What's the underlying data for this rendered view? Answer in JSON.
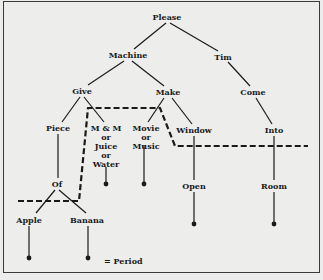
{
  "diagram": {
    "nodes": {
      "please": "Please",
      "machine": "Machine",
      "tim": "Tim",
      "give": "Give",
      "make": "Make",
      "come": "Come",
      "piece": "Piece",
      "mm": "M & M",
      "mm_or1": "or",
      "mm_juice": "Juice",
      "mm_or2": "or",
      "mm_water": "Water",
      "movie": "Movie",
      "movie_or": "or",
      "movie_music": "Music",
      "window": "Window",
      "into": "Into",
      "of": "Of",
      "open": "Open",
      "room": "Room",
      "apple": "Apple",
      "banana": "Banana"
    },
    "legend": {
      "symbol": "dot",
      "text": "= Period"
    },
    "colors": {
      "ink": "#1a1a1a",
      "paper": "#ededeb"
    }
  }
}
